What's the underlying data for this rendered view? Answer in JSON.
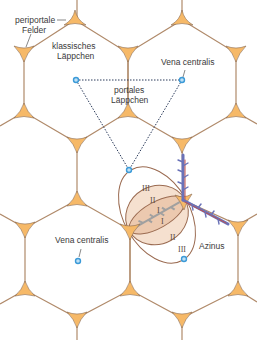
{
  "labels": {
    "periportal": [
      "periportale",
      "Felder"
    ],
    "classic_lobule": [
      "klassisches",
      "Läppchen"
    ],
    "portal_lobule": [
      "portales",
      "Läppchen"
    ],
    "vena_centralis_top": "Vena centralis",
    "vena_centralis_bottom": "Vena centralis",
    "acinus": "Azinus"
  },
  "zones": {
    "zone1_a": "I",
    "zone1_b": "I",
    "zone2_a": "II",
    "zone2_b": "II",
    "zone3_a": "III",
    "zone3_b": "III"
  },
  "colors": {
    "portal_field_fill": "#f6b968",
    "hex_edge": "#b08a6a",
    "central_vein": "#3b9ad8",
    "acinus_fill": "#f2d6bf",
    "acinus_edge": "#9a6a50",
    "vessel_blue": "#6a72b8",
    "vessel_red": "#c0504d",
    "bile_gray": "#9a9a9a"
  },
  "caption": ""
}
